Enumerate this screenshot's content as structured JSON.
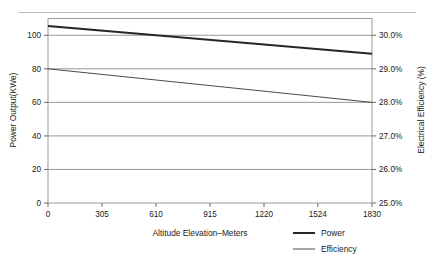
{
  "chart_data": {
    "type": "line",
    "title": "",
    "xlabel": "Altitude Elevation–Meters",
    "ylabel": "Power Output(KWe)",
    "y2label": "Electrical Efficiency (%)",
    "x": [
      0,
      305,
      610,
      915,
      1220,
      1524,
      1830
    ],
    "xticklabels": [
      "0",
      "305",
      "610",
      "915",
      "1220",
      "1524",
      "1830"
    ],
    "xlim": [
      0,
      1830
    ],
    "ylim": [
      0,
      110
    ],
    "yticks": [
      0,
      20,
      40,
      60,
      80,
      100
    ],
    "yticklabels": [
      "0",
      "20",
      "40",
      "60",
      "80",
      "100"
    ],
    "y2lim": [
      25.0,
      30.5
    ],
    "y2ticks": [
      25.0,
      26.0,
      27.0,
      28.0,
      29.0,
      30.0
    ],
    "y2ticklabels": [
      "25.0%",
      "26.0%",
      "27.0%",
      "28.0%",
      "29.0%",
      "30.0%"
    ],
    "grid": true,
    "legend_position": "bottom-right",
    "series": [
      {
        "name": "Power",
        "axis": "left",
        "unit": "KWe",
        "color": "#262626",
        "linewidth": "thick",
        "x": [
          0,
          1830
        ],
        "values": [
          105.5,
          89.0
        ]
      },
      {
        "name": "Efficiency",
        "axis": "right",
        "unit": "%",
        "color": "#4a4a4a",
        "linewidth": "thin",
        "x": [
          0,
          1830
        ],
        "values": [
          29.0,
          28.0
        ],
        "values_on_left_scale": [
          80.0,
          60.0
        ]
      }
    ],
    "legend": [
      {
        "label": "Power",
        "linewidth": "thick",
        "color": "#262626"
      },
      {
        "label": "Efficiency",
        "linewidth": "thin",
        "color": "#4a4a4a"
      }
    ]
  }
}
